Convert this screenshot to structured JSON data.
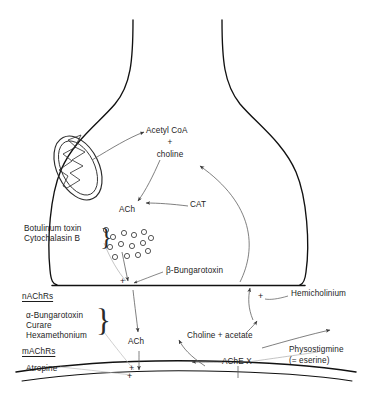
{
  "figure": {
    "type": "diagram"
  },
  "labels": {
    "acetyl_coa": "Acetyl CoA",
    "plus_sign": "+",
    "choline": "choline",
    "cat": "CAT",
    "ach_terminal": "ACh",
    "ach_cleft": "ACh",
    "botulinum_toxin": "Botulinum toxin",
    "cytochalasin_b": "Cytochalasin B",
    "beta_bungarotoxin": "β-Bungarotoxin",
    "nachrs": "nAChRs",
    "alpha_bungarotoxin": "α-Bungarotoxin",
    "curare": "Curare",
    "hexamethonium": "Hexamethonium",
    "machrs": "mAChRs",
    "atropine": "Atropine",
    "hemicholinium": "Hemicholinium",
    "choline_acetate": "Choline + acetate",
    "ache": "AChE X",
    "physostigmine": "Physostigmine",
    "eserine": "(= eserine)",
    "plus_presynaptic": "+",
    "plus_postsynaptic": "+",
    "plus_uptake": "+"
  },
  "organelles": {
    "mitochondrion": "mitochondrion",
    "vesicle_count": 14
  },
  "colors": {
    "ink": "#1d1d1d",
    "membrane": "#111111",
    "arrow": "#555555",
    "background": "#ffffff"
  }
}
